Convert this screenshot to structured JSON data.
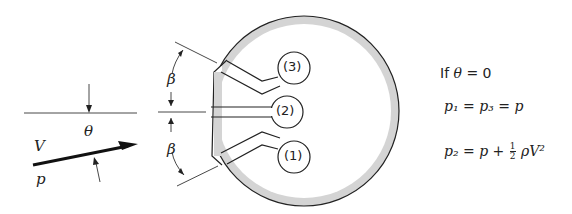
{
  "diagram": {
    "labels": {
      "beta_top": "β",
      "beta_bottom": "β",
      "theta": "θ",
      "velocity": "V",
      "pressure": "p",
      "hole3": "(3)",
      "hole2": "(2)",
      "hole1": "(1)"
    },
    "equations": {
      "condition_prefix": "If",
      "condition_var": "θ",
      "condition_rest": "= 0",
      "eq1": "p₁ = p₃ = p",
      "eq2_lhs": "p₂ = p +",
      "eq2_frac_num": "1",
      "eq2_frac_den": "2",
      "eq2_rhs": "ρV²"
    },
    "colors": {
      "line": "#222222",
      "wall_fill": "#d4d4d4"
    }
  }
}
